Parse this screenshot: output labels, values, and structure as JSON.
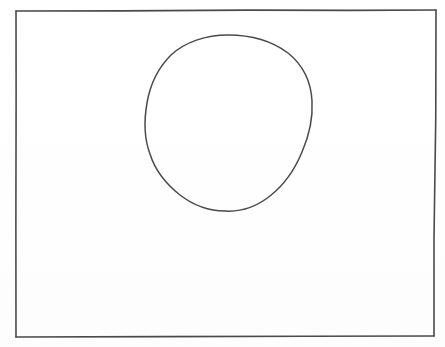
{
  "image": {
    "kind": "scanned-line-drawing",
    "width": 445,
    "height": 347,
    "background_color": "#ffffff",
    "ink_color": "#4a4a4a",
    "description": "A hand-drawn rectangular frame containing a single hand-drawn circle in the upper-centre-left area",
    "alt_text": "Hand drawn rectangle with a circle inside",
    "caption": ""
  },
  "shapes": [
    {
      "name": "frame-rectangle",
      "type": "rectangle",
      "stroke_color": "#4a4a4a",
      "stroke_width": 1.6,
      "fill": "none",
      "x": 16,
      "y": 10,
      "width": 419,
      "height": 327,
      "corners": {
        "top_left": [
          16,
          11
        ],
        "top_right": [
          436,
          10
        ],
        "bottom_right": [
          434,
          336
        ],
        "bottom_left": [
          16,
          337
        ]
      }
    },
    {
      "name": "hand-drawn-circle",
      "type": "circle",
      "stroke_color": "#4a4a4a",
      "stroke_width": 1.5,
      "fill": "none",
      "center_x": 228,
      "center_y": 123,
      "radius_x": 82,
      "radius_y": 88,
      "bounds": {
        "left": 146,
        "top": 35,
        "right": 310,
        "bottom": 211
      },
      "path": "M 228 35 C 252 35 272 41 288 53 C 303 65 311 82 312 101 C 313 118 309 136 302 152 C 295 169 284 185 270 196 C 256 207 240 212 225 211 C 209 211 193 205 180 195 C 166 184 155 170 150 154 C 144 138 144 120 147 103 C 150 85 158 68 171 55 C 185 42 206 35 228 35 Z"
    }
  ]
}
